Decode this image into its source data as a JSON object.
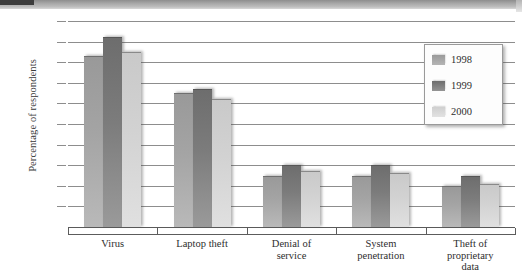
{
  "chart_data": {
    "type": "bar",
    "title": "",
    "xlabel": "",
    "ylabel": "Percentage of respondents",
    "ylim": [
      0,
      100
    ],
    "ytick_labels": [
      "100%",
      "90%",
      "80%",
      "70%",
      "60%",
      "50%",
      "40%",
      "30%",
      "20%",
      "10%",
      "0"
    ],
    "ytick_values": [
      100,
      90,
      80,
      70,
      60,
      50,
      40,
      30,
      20,
      10,
      0
    ],
    "grid": true,
    "legend_position": "upper right",
    "categories": [
      "Virus",
      "Laptop theft",
      "Denial of\nservice",
      "System\npenetration",
      "Theft of\nproprietary\ndata"
    ],
    "category_lines": [
      [
        "Virus"
      ],
      [
        "Laptop theft"
      ],
      [
        "Denial of",
        "service"
      ],
      [
        "System",
        "penetration"
      ],
      [
        "Theft of",
        "proprietary",
        "data"
      ]
    ],
    "series": [
      {
        "name": "1998",
        "color": "#a4a4a4",
        "values": [
          83,
          65,
          25,
          25,
          20
        ]
      },
      {
        "name": "1999",
        "color": "#7c7c7c",
        "values": [
          92,
          67,
          30,
          30,
          25
        ]
      },
      {
        "name": "2000",
        "color": "#d2d2d2",
        "values": [
          85,
          62,
          27,
          26,
          21
        ]
      }
    ]
  },
  "legend": {
    "items": [
      {
        "label": "1998"
      },
      {
        "label": "1999"
      },
      {
        "label": "2000"
      }
    ]
  }
}
